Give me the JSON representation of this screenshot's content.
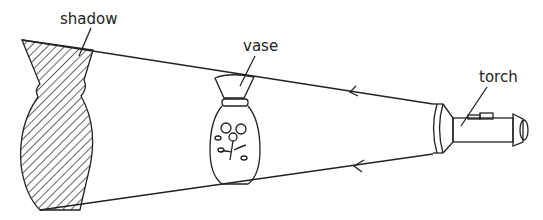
{
  "diagram": {
    "labels": {
      "shadow": "shadow",
      "vase": "vase",
      "torch": "torch"
    },
    "colors": {
      "ink": "#222222",
      "background": "#ffffff"
    }
  }
}
